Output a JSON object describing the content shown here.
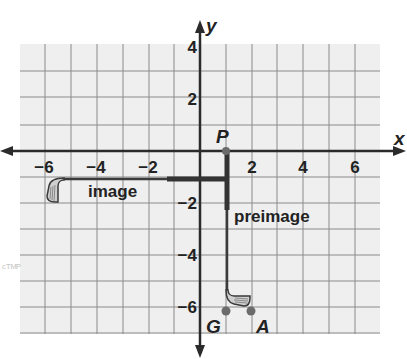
{
  "figure": {
    "type": "coordinate-plane-transformation",
    "axes": {
      "x_label": "x",
      "y_label": "y",
      "x_ticks": [
        {
          "value": -6,
          "label": "−6"
        },
        {
          "value": -4,
          "label": "−4"
        },
        {
          "value": -2,
          "label": "−2"
        },
        {
          "value": 2,
          "label": "2"
        },
        {
          "value": 4,
          "label": "4"
        },
        {
          "value": 6,
          "label": "6"
        }
      ],
      "y_ticks": [
        {
          "value": 4,
          "label": "4"
        },
        {
          "value": 2,
          "label": "2"
        },
        {
          "value": -2,
          "label": "−2"
        },
        {
          "value": -4,
          "label": "−4"
        },
        {
          "value": -6,
          "label": "−6"
        }
      ],
      "x_range": [
        -7,
        7
      ],
      "y_range": [
        -7,
        4
      ],
      "grid": true,
      "grid_step": 1
    },
    "points": [
      {
        "name": "P",
        "x": 1,
        "y": 0
      },
      {
        "name": "G",
        "x": 1,
        "y": -6
      },
      {
        "name": "A",
        "x": 2,
        "y": -6
      }
    ],
    "shapes": [
      {
        "name": "preimage",
        "label": "preimage",
        "description": "golf club, shaft vertical along x = 1 from P down to head near G and A"
      },
      {
        "name": "image",
        "label": "image",
        "description": "golf club rotated 90° about P, shaft horizontal along y ≈ -1 extending left to x ≈ -6"
      }
    ],
    "colors": {
      "grid_bg": "#efefef",
      "grid_line": "#8a8a8a",
      "axis": "#2b2b2b",
      "point": "#6b6b6b",
      "club": "#3a3a3a"
    },
    "faint_mark": "ᶜᵀᴹᴾ"
  }
}
